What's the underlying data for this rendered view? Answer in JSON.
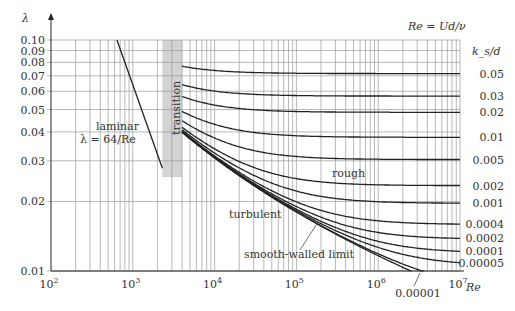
{
  "chart_data": {
    "type": "line",
    "xlabel": "Re",
    "ylabel": "λ",
    "x_scale": "log",
    "y_scale": "log",
    "xlim": [
      100,
      10000000
    ],
    "ylim": [
      0.01,
      0.1
    ],
    "grid": true,
    "x_ticks": [
      {
        "value": 100,
        "base": "10",
        "exp": "2"
      },
      {
        "value": 1000,
        "base": "10",
        "exp": "3"
      },
      {
        "value": 10000,
        "base": "10",
        "exp": "4"
      },
      {
        "value": 100000,
        "base": "10",
        "exp": "5"
      },
      {
        "value": 1000000,
        "base": "10",
        "exp": "6"
      },
      {
        "value": 10000000,
        "base": "10",
        "exp": "7"
      }
    ],
    "y_ticks": [
      {
        "value": 0.1,
        "label": "0.10"
      },
      {
        "value": 0.09,
        "label": "0.09"
      },
      {
        "value": 0.08,
        "label": "0.08"
      },
      {
        "value": 0.07,
        "label": "0.07"
      },
      {
        "value": 0.06,
        "label": "0.06"
      },
      {
        "value": 0.05,
        "label": "0.05"
      },
      {
        "value": 0.04,
        "label": "0.04"
      },
      {
        "value": 0.03,
        "label": "0.03"
      },
      {
        "value": 0.02,
        "label": "0.02"
      },
      {
        "value": 0.01,
        "label": "0.01"
      }
    ],
    "re_definition": "Re = Ud/ν",
    "roughness_header": "k_s/d",
    "laminar": {
      "formula": "λ = 64/Re",
      "label_line1": "laminar",
      "label_line2": "λ = 64/Re",
      "re_range": [
        640,
        2300
      ]
    },
    "transition": {
      "label": "transition",
      "re_range": [
        2300,
        4000
      ],
      "lambda_range": [
        0.0255,
        0.1
      ],
      "color": "#d3d3d3"
    },
    "turbulent": {
      "model": "Colebrook-White",
      "re_range": [
        4000,
        10000000
      ],
      "series": [
        {
          "name": "0.05",
          "ks_d": 0.05,
          "label": "0.05"
        },
        {
          "name": "0.03",
          "ks_d": 0.03,
          "label": "0.03"
        },
        {
          "name": "0.02",
          "ks_d": 0.02,
          "label": "0.02"
        },
        {
          "name": "0.01",
          "ks_d": 0.01,
          "label": "0.01"
        },
        {
          "name": "0.005",
          "ks_d": 0.005,
          "label": "0.005"
        },
        {
          "name": "0.002",
          "ks_d": 0.002,
          "label": "0.002"
        },
        {
          "name": "0.001",
          "ks_d": 0.001,
          "label": "0.001"
        },
        {
          "name": "0.0004",
          "ks_d": 0.0004,
          "label": "0.0004"
        },
        {
          "name": "0.0002",
          "ks_d": 0.0002,
          "label": "0.0002"
        },
        {
          "name": "0.0001",
          "ks_d": 0.0001,
          "label": "0.0001"
        },
        {
          "name": "0.00005",
          "ks_d": 5e-05,
          "label": "0.00005"
        },
        {
          "name": "0.00001",
          "ks_d": 1e-05,
          "label": "0.00001"
        },
        {
          "name": "smooth",
          "ks_d": 0,
          "label": ""
        }
      ]
    },
    "annotations": {
      "rough": "rough",
      "turbulent": "turbulent",
      "smooth_limit": "smooth-walled limit"
    }
  }
}
